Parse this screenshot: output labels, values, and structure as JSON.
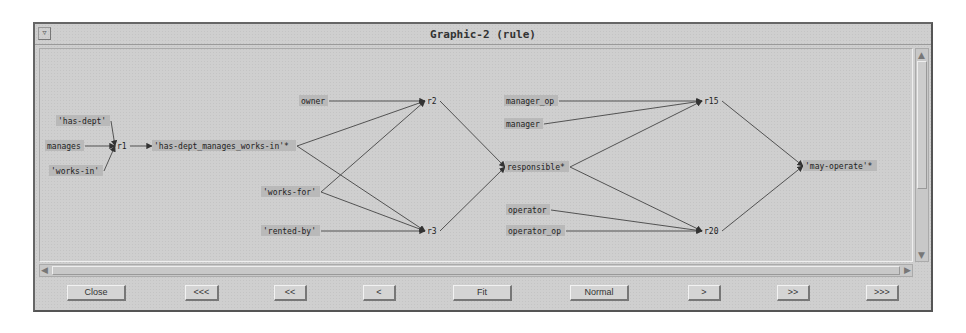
{
  "window": {
    "title": "Graphic-2 (rule)",
    "menu_icon": "window-menu-icon"
  },
  "graph": {
    "nodes": [
      {
        "id": "has-dept",
        "label": "'has-dept'",
        "x": 57,
        "y": 121
      },
      {
        "id": "manages",
        "label": "manages",
        "x": 46,
        "y": 146
      },
      {
        "id": "works-in",
        "label": "'works-in'",
        "x": 50,
        "y": 171
      },
      {
        "id": "r1",
        "label": "r1",
        "x": 116,
        "y": 146
      },
      {
        "id": "has-dept_manages_works-in",
        "label": "'has-dept_manages_works-in'*",
        "x": 153,
        "y": 146
      },
      {
        "id": "owner",
        "label": "owner",
        "x": 300,
        "y": 101
      },
      {
        "id": "works-for",
        "label": "'works-for'",
        "x": 262,
        "y": 192
      },
      {
        "id": "rented-by",
        "label": "'rented-by'",
        "x": 262,
        "y": 231
      },
      {
        "id": "r2",
        "label": "r2",
        "x": 426,
        "y": 101
      },
      {
        "id": "r3",
        "label": "r3",
        "x": 426,
        "y": 231
      },
      {
        "id": "responsible",
        "label": "responsible*",
        "x": 506,
        "y": 167
      },
      {
        "id": "manager_op",
        "label": "manager_op",
        "x": 505,
        "y": 101
      },
      {
        "id": "manager",
        "label": "manager",
        "x": 505,
        "y": 124
      },
      {
        "id": "r15",
        "label": "r15",
        "x": 703,
        "y": 101
      },
      {
        "id": "operator",
        "label": "operator",
        "x": 507,
        "y": 210
      },
      {
        "id": "operator_op",
        "label": "operator_op",
        "x": 507,
        "y": 231
      },
      {
        "id": "r20",
        "label": "r20",
        "x": 703,
        "y": 231
      },
      {
        "id": "may-operate",
        "label": "'may-operate'*",
        "x": 804,
        "y": 166
      }
    ],
    "edges": [
      [
        "has-dept",
        "r1"
      ],
      [
        "manages",
        "r1"
      ],
      [
        "works-in",
        "r1"
      ],
      [
        "r1",
        "has-dept_manages_works-in"
      ],
      [
        "owner",
        "r2"
      ],
      [
        "has-dept_manages_works-in",
        "r2"
      ],
      [
        "works-for",
        "r2"
      ],
      [
        "has-dept_manages_works-in",
        "r3"
      ],
      [
        "works-for",
        "r3"
      ],
      [
        "rented-by",
        "r3"
      ],
      [
        "r2",
        "responsible"
      ],
      [
        "r3",
        "responsible"
      ],
      [
        "manager_op",
        "r15"
      ],
      [
        "manager",
        "r15"
      ],
      [
        "responsible",
        "r15"
      ],
      [
        "responsible",
        "r20"
      ],
      [
        "operator",
        "r20"
      ],
      [
        "operator_op",
        "r20"
      ],
      [
        "r15",
        "may-operate"
      ],
      [
        "r20",
        "may-operate"
      ]
    ]
  },
  "buttons": [
    {
      "id": "close",
      "label": "Close"
    },
    {
      "id": "first",
      "label": "<<<"
    },
    {
      "id": "prev-fast",
      "label": "<<"
    },
    {
      "id": "prev",
      "label": "<"
    },
    {
      "id": "fit",
      "label": "Fit"
    },
    {
      "id": "normal",
      "label": "Normal"
    },
    {
      "id": "next",
      "label": ">"
    },
    {
      "id": "next-fast",
      "label": ">>"
    },
    {
      "id": "last",
      "label": ">>>"
    }
  ],
  "colors": {
    "window_bg": "#cfcfcf",
    "node_bg": "#b9b9b9",
    "edge": "#444444"
  }
}
